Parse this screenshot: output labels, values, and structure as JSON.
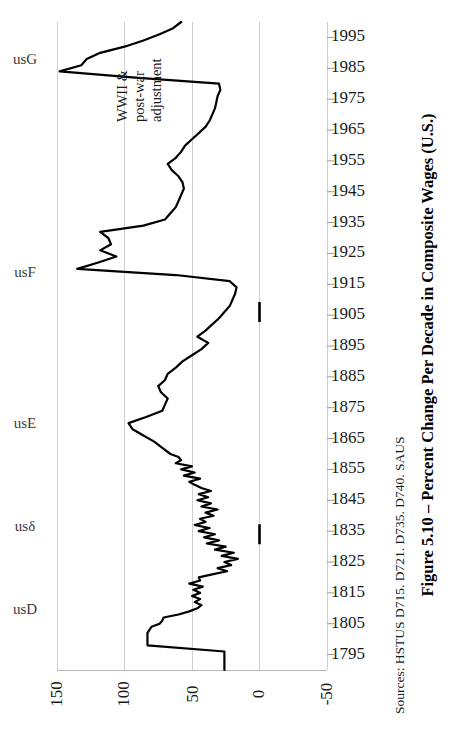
{
  "figure": {
    "title": "Figure 5.10 – Percent Change Per Decade in Composite Wages (U.S.)",
    "sources": "Sources: HSTUS D715. D721. D735. D740. SAUS"
  },
  "annotation": {
    "line1": "WWII &",
    "line2": "post-war",
    "line3": "adjustment"
  },
  "series_labels": [
    {
      "label": "usG",
      "top": 42
    },
    {
      "label": "usF",
      "top": 255
    },
    {
      "label": "usE",
      "top": 406
    },
    {
      "label": "usδ",
      "top": 509
    },
    {
      "label": "usD",
      "top": 592
    }
  ],
  "chart_data": {
    "type": "line",
    "orientation": "rotated-90-year-axis-vertical",
    "title": "Figure 5.10 – Percent Change Per Decade in Composite Wages (U.S.)",
    "xlabel": "Percent Change Per Decade",
    "ylabel": "Year",
    "grid": true,
    "legend_position": "inline-left",
    "value_axis": {
      "ticks": [
        150,
        100,
        50,
        0,
        -50
      ],
      "tick_labels": [
        "150",
        "100",
        "50",
        "0",
        "-50"
      ],
      "range": [
        -50,
        150
      ],
      "inverted": true
    },
    "year_axis": {
      "ticks": [
        1795,
        1805,
        1815,
        1825,
        1835,
        1845,
        1855,
        1865,
        1875,
        1885,
        1895,
        1905,
        1915,
        1925,
        1935,
        1945,
        1955,
        1965,
        1975,
        1985,
        1995
      ],
      "tick_labels": [
        "1795",
        "1805",
        "1815",
        "1825",
        "1835",
        "1845",
        "1855",
        "1865",
        "1875",
        "1885",
        "1895",
        "1905",
        "1915",
        "1925",
        "1935",
        "1945",
        "1955",
        "1965",
        "1975",
        "1985",
        "1995"
      ],
      "range": [
        1790,
        2000
      ]
    },
    "x": [
      1790,
      1792,
      1794,
      1796,
      1798,
      1800,
      1802,
      1804,
      1805,
      1806,
      1807,
      1808,
      1809,
      1810,
      1811,
      1812,
      1813,
      1814,
      1815,
      1816,
      1817,
      1818,
      1819,
      1820,
      1821,
      1822,
      1823,
      1824,
      1825,
      1826,
      1827,
      1828,
      1829,
      1830,
      1831,
      1832,
      1833,
      1834,
      1835,
      1836,
      1837,
      1838,
      1839,
      1840,
      1841,
      1842,
      1843,
      1844,
      1845,
      1846,
      1847,
      1848,
      1849,
      1850,
      1851,
      1852,
      1853,
      1854,
      1855,
      1856,
      1857,
      1858,
      1859,
      1860,
      1862,
      1864,
      1866,
      1868,
      1870,
      1872,
      1874,
      1876,
      1878,
      1880,
      1882,
      1884,
      1886,
      1888,
      1890,
      1892,
      1894,
      1896,
      1898,
      1900,
      1902,
      1904,
      1906,
      1908,
      1910,
      1912,
      1914,
      1916,
      1918,
      1920,
      1922,
      1924,
      1926,
      1928,
      1930,
      1932,
      1934,
      1936,
      1938,
      1940,
      1942,
      1944,
      1946,
      1948,
      1950,
      1952,
      1954,
      1956,
      1958,
      1960,
      1962,
      1964,
      1966,
      1968,
      1970,
      1972,
      1974,
      1976,
      1978,
      1980,
      1982,
      1984,
      1986,
      1988,
      1990,
      1992,
      1994,
      1996,
      1998,
      2000
    ],
    "y": [
      26,
      26,
      26,
      26,
      83,
      83,
      83,
      80,
      74,
      72,
      71,
      60,
      52,
      46,
      43,
      48,
      44,
      50,
      44,
      49,
      42,
      52,
      44,
      45,
      35,
      24,
      31,
      21,
      26,
      16,
      28,
      19,
      33,
      25,
      39,
      30,
      41,
      33,
      45,
      37,
      48,
      40,
      44,
      34,
      40,
      31,
      43,
      36,
      46,
      38,
      45,
      36,
      43,
      48,
      52,
      44,
      56,
      48,
      58,
      50,
      62,
      58,
      60,
      66,
      72,
      78,
      86,
      94,
      97,
      84,
      72,
      70,
      68,
      73,
      75,
      70,
      68,
      62,
      57,
      50,
      43,
      38,
      46,
      40,
      35,
      30,
      26,
      22,
      20,
      18,
      17,
      22,
      62,
      135,
      120,
      106,
      118,
      110,
      112,
      118,
      86,
      70,
      66,
      62,
      60,
      58,
      56,
      57,
      60,
      65,
      68,
      62,
      58,
      55,
      50,
      45,
      40,
      37,
      35,
      33,
      32,
      31,
      29,
      30,
      92,
      148,
      132,
      128,
      118,
      100,
      86,
      74,
      64,
      58,
      52,
      48,
      44,
      42
    ],
    "annotations": [
      {
        "text": "WWII & post-war adjustment",
        "year": 1947,
        "value": 130
      }
    ],
    "series_markers": [
      {
        "label": "usD",
        "year": 1810
      },
      {
        "label": "usδ",
        "year": 1838
      },
      {
        "label": "usE",
        "year": 1871
      },
      {
        "label": "usF",
        "year": 1919
      },
      {
        "label": "usG",
        "year": 1982
      }
    ],
    "marker_bars": [
      {
        "year": 1834,
        "value": 0
      },
      {
        "year": 1906,
        "value": 0
      }
    ]
  }
}
